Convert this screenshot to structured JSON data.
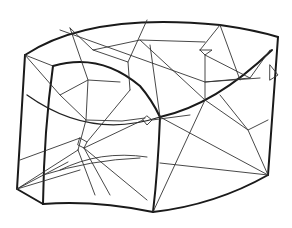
{
  "figure": {
    "type": "line-drawing",
    "stroke_color": "#1a1a1a",
    "background": "#ffffff"
  }
}
